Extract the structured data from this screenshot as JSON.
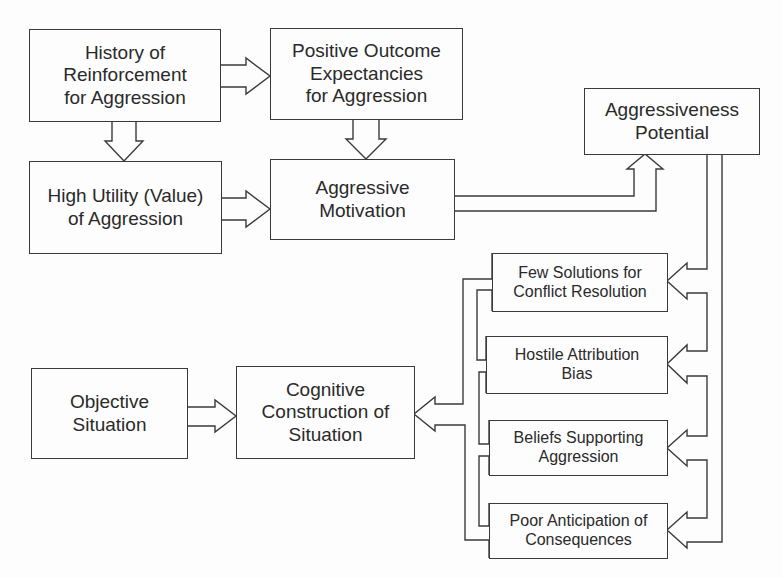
{
  "diagram": {
    "type": "flowchart",
    "nodes": {
      "history_reinforcement": {
        "label": "History of\nReinforcement\nfor Aggression"
      },
      "positive_outcome": {
        "label": "Positive Outcome\nExpectancies\nfor Aggression"
      },
      "high_utility": {
        "label": "High Utility (Value)\nof Aggression"
      },
      "aggressive_motivation": {
        "label": "Aggressive\nMotivation"
      },
      "aggressiveness_potential": {
        "label": "Aggressiveness\nPotential"
      },
      "few_solutions": {
        "label": "Few Solutions for\nConflict Resolution"
      },
      "hostile_attribution": {
        "label": "Hostile Attribution\nBias"
      },
      "beliefs_supporting": {
        "label": "Beliefs Supporting\nAggression"
      },
      "poor_anticipation": {
        "label": "Poor Anticipation of\nConsequences"
      },
      "objective_situation": {
        "label": "Objective\nSituation"
      },
      "cognitive_construction": {
        "label": "Cognitive\nConstruction of\nSituation"
      }
    },
    "edges": [
      {
        "from": "history_reinforcement",
        "to": "positive_outcome"
      },
      {
        "from": "history_reinforcement",
        "to": "high_utility"
      },
      {
        "from": "positive_outcome",
        "to": "aggressive_motivation"
      },
      {
        "from": "high_utility",
        "to": "aggressive_motivation"
      },
      {
        "from": "aggressive_motivation",
        "to": "aggressiveness_potential"
      },
      {
        "from": "aggressiveness_potential",
        "to": "few_solutions"
      },
      {
        "from": "aggressiveness_potential",
        "to": "hostile_attribution"
      },
      {
        "from": "aggressiveness_potential",
        "to": "beliefs_supporting"
      },
      {
        "from": "aggressiveness_potential",
        "to": "poor_anticipation"
      },
      {
        "from": "few_solutions",
        "to": "cognitive_construction"
      },
      {
        "from": "hostile_attribution",
        "to": "cognitive_construction"
      },
      {
        "from": "beliefs_supporting",
        "to": "cognitive_construction"
      },
      {
        "from": "poor_anticipation",
        "to": "cognitive_construction"
      },
      {
        "from": "objective_situation",
        "to": "cognitive_construction"
      }
    ],
    "colors": {
      "line": "#3a3a3a",
      "text": "#2a2a2a",
      "background": "#fdfdfd"
    }
  }
}
